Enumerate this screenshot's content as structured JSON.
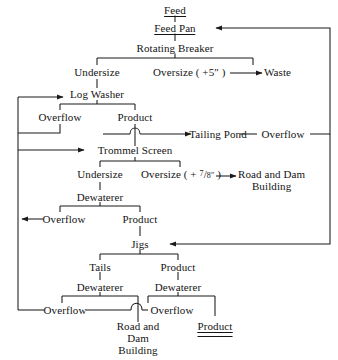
{
  "diagram": {
    "type": "process-flow-diagram",
    "nodes": {
      "feed": "Feed",
      "feed_pan": "Feed Pan",
      "rotating_breaker": "Rotating Breaker",
      "undersize_1": "Undersize",
      "oversize_1_pre": "Oversize ( +5",
      "oversize_1_post": " )",
      "oversize_1_unit": "″",
      "waste": "Waste",
      "log_washer": "Log Washer",
      "overflow_1": "Overflow",
      "product_1": "Product",
      "tailing_pond": "Tailing Pond",
      "overflow_tp": "Overflow",
      "trommel_screen": "Trommel Screen",
      "undersize_2": "Undersize",
      "oversize_2_pre": "Oversize ( + ",
      "oversize_2_num": "7",
      "oversize_2_slash": "/",
      "oversize_2_den": "8″",
      "oversize_2_post": " )",
      "road_dam_1_line1": "Road and Dam",
      "road_dam_1_line2": "Building",
      "dewaterer_1": "Dewaterer",
      "overflow_2": "Overflow",
      "product_2": "Product",
      "jigs": "Jigs",
      "tails": "Tails",
      "product_3": "Product",
      "dewaterer_2": "Dewaterer",
      "dewaterer_3": "Dewaterer",
      "overflow_3": "Overflow",
      "overflow_4": "Overflow",
      "road_dam_2_line1": "Road and",
      "road_dam_2_line2": "Dam",
      "road_dam_2_line3": "Building",
      "final_product": "Product"
    },
    "colors": {
      "line": "#1a1a1a",
      "text": "#141414",
      "background": "#ffffff"
    },
    "flow_sequence": [
      "Feed → Feed Pan → Rotating Breaker",
      "Rotating Breaker → Undersize | Oversize ( +5″ ) → Waste",
      "Undersize → Log Washer",
      "Log Washer → Overflow | Product",
      "Product → Tailing Pond → Overflow → (recycle to Feed Pan)",
      "Overflow (Log Washer) → Trommel Screen",
      "Trommel Screen → Undersize | Oversize ( + 7/8″ ) → Road and Dam Building",
      "Undersize → Dewaterer → Overflow | Product",
      "Product → Jigs",
      "Jigs → Tails | Product",
      "Tails → Dewaterer → Overflow (→ Road and Dam Building)",
      "Product → Dewaterer → Overflow | Product (final)"
    ]
  }
}
